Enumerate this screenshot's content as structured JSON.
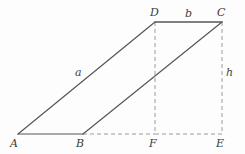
{
  "figure": {
    "kind": "geometry-diagram",
    "shape": "parallelogram-with-height-construction",
    "width": 245,
    "height": 154,
    "background_color": "#fdfdfd",
    "stroke_color": "#555555",
    "dashed_color": "#999999",
    "label_color": "#3b3b3b"
  },
  "vertices": [
    {
      "id": "A",
      "label": "A",
      "x": 18,
      "y": 134
    },
    {
      "id": "B",
      "label": "B",
      "x": 83,
      "y": 134
    },
    {
      "id": "F",
      "label": "F",
      "x": 155,
      "y": 134
    },
    {
      "id": "E",
      "label": "E",
      "x": 222,
      "y": 134
    },
    {
      "id": "D",
      "label": "D",
      "x": 155,
      "y": 22
    },
    {
      "id": "C",
      "label": "C",
      "x": 222,
      "y": 22
    }
  ],
  "edges": [
    {
      "id": "AB",
      "from": "A",
      "to": "B",
      "style": "solid",
      "role": "base-segment"
    },
    {
      "id": "AD",
      "from": "A",
      "to": "D",
      "style": "solid",
      "role": "slant-side"
    },
    {
      "id": "DC",
      "from": "D",
      "to": "C",
      "style": "solid",
      "role": "top-side"
    },
    {
      "id": "BC",
      "from": "B",
      "to": "C",
      "style": "solid",
      "role": "slant-side"
    },
    {
      "id": "BF",
      "from": "B",
      "to": "F",
      "style": "dashed",
      "role": "base-extension"
    },
    {
      "id": "FE",
      "from": "F",
      "to": "E",
      "style": "dashed",
      "role": "base-extension"
    },
    {
      "id": "DF",
      "from": "D",
      "to": "F",
      "style": "dashed",
      "role": "height-drop"
    },
    {
      "id": "CE",
      "from": "C",
      "to": "E",
      "style": "dashed",
      "role": "height-drop"
    }
  ],
  "measures": [
    {
      "id": "a",
      "label": "a",
      "edge": "AD",
      "x": 75,
      "y": 67,
      "meaning": "slant-side-length"
    },
    {
      "id": "b",
      "label": "b",
      "edge": "DC",
      "x": 185,
      "y": 8,
      "meaning": "top-side-length"
    },
    {
      "id": "h",
      "label": "h",
      "edge": "CE",
      "x": 226,
      "y": 67,
      "meaning": "height"
    }
  ]
}
